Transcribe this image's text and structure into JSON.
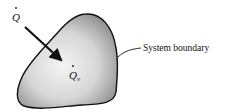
{
  "diagram": {
    "heat_flux_label": "Q",
    "heat_generation_label": "Q",
    "heat_generation_subscript": "v",
    "boundary_label": "System boundary",
    "colors": {
      "outline": "#111111",
      "fill_light": "#f4f4f4",
      "fill_dark": "#8a8a8a",
      "text": "#111111"
    }
  }
}
